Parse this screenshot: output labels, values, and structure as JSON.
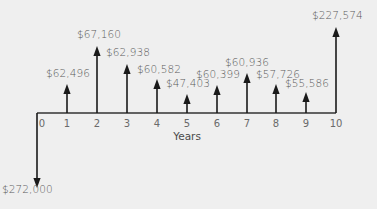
{
  "diagram": {
    "type": "cash-flow-diagram",
    "x_axis_title": "Years",
    "periods": [
      "0",
      "1",
      "2",
      "3",
      "4",
      "5",
      "6",
      "7",
      "8",
      "9",
      "10"
    ],
    "note": "Arrow lengths show inflow/outflow direction only; they are not drawn to a common scale.",
    "flows": [
      {
        "year": "0",
        "direction": "down",
        "value": -272000,
        "label": "$272,000"
      },
      {
        "year": "1",
        "direction": "up",
        "value": 62496,
        "label": "$62,496"
      },
      {
        "year": "2",
        "direction": "up",
        "value": 67160,
        "label": "$67,160"
      },
      {
        "year": "3",
        "direction": "up",
        "value": 62938,
        "label": "$62,938"
      },
      {
        "year": "4",
        "direction": "up",
        "value": 60582,
        "label": "$60,582"
      },
      {
        "year": "5",
        "direction": "up",
        "value": 47403,
        "label": "$47,403"
      },
      {
        "year": "6",
        "direction": "up",
        "value": 60399,
        "label": "$60,399"
      },
      {
        "year": "7",
        "direction": "up",
        "value": 60936,
        "label": "$60,936"
      },
      {
        "year": "8",
        "direction": "up",
        "value": 57726,
        "label": "$57,726"
      },
      {
        "year": "9",
        "direction": "up",
        "value": 55586,
        "label": "$55,586"
      },
      {
        "year": "10",
        "direction": "up",
        "value": 227574,
        "label": "$227,574"
      }
    ],
    "colors": {
      "background": "#efefef",
      "arrow": "#1a1a1a",
      "axis": "#333333",
      "label_text": "#5a5a5a"
    }
  },
  "layout": {
    "axis_y": 113,
    "year_x": [
      37,
      67,
      97,
      127,
      157,
      187,
      217,
      247,
      276,
      306,
      336
    ],
    "arrow_tip_y": [
      188,
      84,
      46,
      64,
      79,
      94,
      85,
      73,
      84,
      92,
      27
    ],
    "label_pos": [
      {
        "x": 2,
        "y": 183
      },
      {
        "x": 46,
        "y": 67
      },
      {
        "x": 77,
        "y": 28
      },
      {
        "x": 106,
        "y": 46
      },
      {
        "x": 137,
        "y": 63
      },
      {
        "x": 166,
        "y": 77
      },
      {
        "x": 196,
        "y": 68
      },
      {
        "x": 225,
        "y": 56
      },
      {
        "x": 256,
        "y": 68
      },
      {
        "x": 285,
        "y": 77
      },
      {
        "x": 312,
        "y": 9
      }
    ],
    "tick_label_y": 118,
    "axis_title_y": 130
  }
}
